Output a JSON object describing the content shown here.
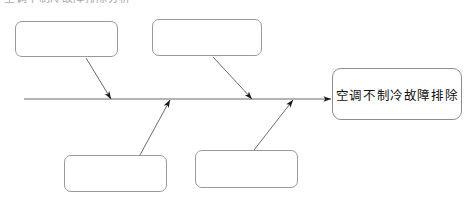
{
  "document": {
    "clipped_heading_fragment": "空调不制冷故障排除分析",
    "diagram_type": "fishbone-cause-and-effect"
  },
  "colors": {
    "background": "#ffffff",
    "box_border": "#999999",
    "head_box_border": "#8c8c8c",
    "line": "#6b6b6b",
    "arrow": "#1a1a1a",
    "text": "#101010"
  },
  "diagram": {
    "spine": {
      "label": "",
      "x_start": 24,
      "x_end": 333,
      "y": 99
    },
    "head": {
      "label": "空调不制冷故障排除",
      "x": 332,
      "y": 68,
      "width": 130,
      "height": 52
    },
    "causes": [
      {
        "label": "",
        "position": "upper",
        "x": 15,
        "y": 21,
        "width": 103,
        "height": 36
      },
      {
        "label": "",
        "position": "upper",
        "x": 152,
        "y": 19,
        "width": 110,
        "height": 37
      },
      {
        "label": "",
        "position": "lower",
        "x": 64,
        "y": 155,
        "width": 103,
        "height": 37
      },
      {
        "label": "",
        "position": "lower",
        "x": 195,
        "y": 150,
        "width": 103,
        "height": 38
      }
    ],
    "connectors": [
      {
        "from_cause": 0,
        "x1": 86,
        "y1": 58,
        "x2": 111,
        "y2": 99
      },
      {
        "from_cause": 1,
        "x1": 213,
        "y1": 57,
        "x2": 252,
        "y2": 99
      },
      {
        "from_cause": 2,
        "x1": 140,
        "y1": 155,
        "x2": 170,
        "y2": 100
      },
      {
        "from_cause": 3,
        "x1": 254,
        "y1": 150,
        "x2": 293,
        "y2": 100
      }
    ]
  }
}
